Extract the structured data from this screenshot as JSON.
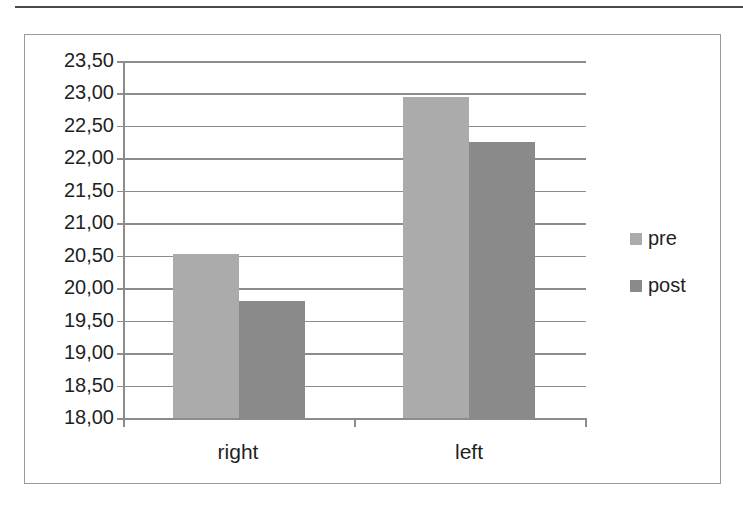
{
  "page": {
    "header_text_fragment": "…"
  },
  "colors": {
    "pre": "#ababab",
    "post": "#8a8a8a",
    "grid": "#8c8c8c",
    "frame": "#9a9a9a"
  },
  "chart_data": {
    "type": "bar",
    "title": "",
    "xlabel": "",
    "ylabel": "",
    "categories": [
      "right",
      "left"
    ],
    "series": [
      {
        "name": "pre",
        "values": [
          20.53,
          22.95
        ]
      },
      {
        "name": "post",
        "values": [
          19.81,
          22.25
        ]
      }
    ],
    "ylim": [
      18.0,
      23.5
    ],
    "yticks": [
      "18,00",
      "18,50",
      "19,00",
      "19,50",
      "20,00",
      "20,50",
      "21,00",
      "21,50",
      "22,00",
      "22,50",
      "23,00",
      "23,50"
    ],
    "grid": true,
    "legend": {
      "position": "right",
      "entries": [
        "pre",
        "post"
      ]
    }
  }
}
